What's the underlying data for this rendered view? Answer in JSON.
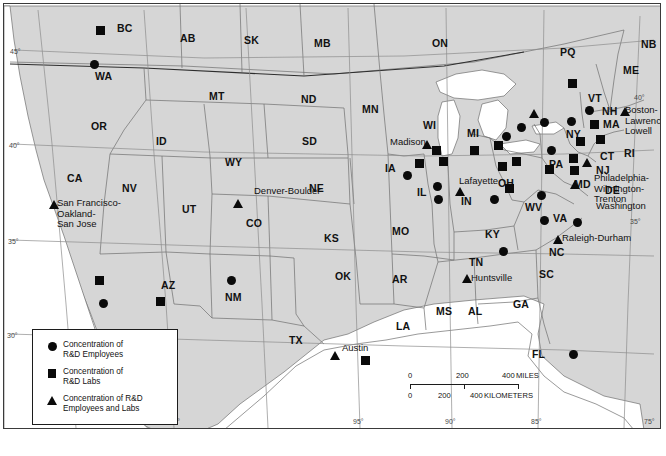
{
  "figure": {
    "background": "#ffffff",
    "land_color": "#d6d6d6",
    "marker_color": "#0a0a0a"
  },
  "legend": {
    "entries": [
      {
        "symbol": "circle",
        "label": "Concentration of\nR&D Employees"
      },
      {
        "symbol": "square",
        "label": "Concentration of\nR&D Labs"
      },
      {
        "symbol": "triangle",
        "label": "Concentration of R&D\nEmployees and Labs"
      }
    ]
  },
  "scalebar": {
    "miles": {
      "ticks": [
        "0",
        "200",
        "400"
      ],
      "unit": "MILES"
    },
    "kilometers": {
      "ticks": [
        "0",
        "200",
        "400"
      ],
      "unit": "KILOMETERS"
    }
  },
  "graticule": {
    "latitude_labels": [
      "45°",
      "40°",
      "35°",
      "30°"
    ],
    "longitude_labels": [
      "120°",
      "115°",
      "95°",
      "90°",
      "85°",
      "75°"
    ],
    "right_edge_labels": [
      "40°",
      "35°"
    ]
  },
  "state_labels": [
    {
      "text": "BC",
      "x": 113,
      "y": 18
    },
    {
      "text": "AB",
      "x": 176,
      "y": 28
    },
    {
      "text": "SK",
      "x": 240,
      "y": 30
    },
    {
      "text": "MB",
      "x": 310,
      "y": 33
    },
    {
      "text": "ON",
      "x": 428,
      "y": 33
    },
    {
      "text": "PQ",
      "x": 556,
      "y": 42
    },
    {
      "text": "NB",
      "x": 637,
      "y": 34
    },
    {
      "text": "ME",
      "x": 619,
      "y": 60
    },
    {
      "text": "WA",
      "x": 91,
      "y": 66
    },
    {
      "text": "MT",
      "x": 205,
      "y": 86
    },
    {
      "text": "ND",
      "x": 297,
      "y": 89
    },
    {
      "text": "MN",
      "x": 358,
      "y": 99
    },
    {
      "text": "WI",
      "x": 419,
      "y": 115
    },
    {
      "text": "MI",
      "x": 463,
      "y": 123
    },
    {
      "text": "VT",
      "x": 584,
      "y": 88
    },
    {
      "text": "NH",
      "x": 598,
      "y": 101
    },
    {
      "text": "MA",
      "x": 599,
      "y": 114
    },
    {
      "text": "NY",
      "x": 562,
      "y": 124
    },
    {
      "text": "OR",
      "x": 87,
      "y": 116
    },
    {
      "text": "ID",
      "x": 152,
      "y": 131
    },
    {
      "text": "SD",
      "x": 298,
      "y": 131
    },
    {
      "text": "IA",
      "x": 381,
      "y": 158
    },
    {
      "text": "PA",
      "x": 545,
      "y": 154
    },
    {
      "text": "CT",
      "x": 596,
      "y": 146
    },
    {
      "text": "RI",
      "x": 620,
      "y": 143
    },
    {
      "text": "NJ",
      "x": 592,
      "y": 160
    },
    {
      "text": "WY",
      "x": 221,
      "y": 152
    },
    {
      "text": "NE",
      "x": 305,
      "y": 178
    },
    {
      "text": "IL",
      "x": 413,
      "y": 182
    },
    {
      "text": "IN",
      "x": 457,
      "y": 191
    },
    {
      "text": "OH",
      "x": 494,
      "y": 173
    },
    {
      "text": "MD",
      "x": 570,
      "y": 174
    },
    {
      "text": "DE",
      "x": 601,
      "y": 180
    },
    {
      "text": "CA",
      "x": 63,
      "y": 168
    },
    {
      "text": "NV",
      "x": 118,
      "y": 178
    },
    {
      "text": "UT",
      "x": 178,
      "y": 199
    },
    {
      "text": "CO",
      "x": 242,
      "y": 213
    },
    {
      "text": "KS",
      "x": 320,
      "y": 228
    },
    {
      "text": "MO",
      "x": 388,
      "y": 221
    },
    {
      "text": "KY",
      "x": 481,
      "y": 224
    },
    {
      "text": "WV",
      "x": 521,
      "y": 197
    },
    {
      "text": "VA",
      "x": 549,
      "y": 208
    },
    {
      "text": "NC",
      "x": 545,
      "y": 242
    },
    {
      "text": "AZ",
      "x": 157,
      "y": 275
    },
    {
      "text": "NM",
      "x": 221,
      "y": 287
    },
    {
      "text": "OK",
      "x": 331,
      "y": 266
    },
    {
      "text": "AR",
      "x": 388,
      "y": 269
    },
    {
      "text": "TN",
      "x": 465,
      "y": 252
    },
    {
      "text": "SC",
      "x": 535,
      "y": 264
    },
    {
      "text": "MS",
      "x": 432,
      "y": 301
    },
    {
      "text": "AL",
      "x": 464,
      "y": 301
    },
    {
      "text": "GA",
      "x": 509,
      "y": 294
    },
    {
      "text": "TX",
      "x": 285,
      "y": 330
    },
    {
      "text": "LA",
      "x": 392,
      "y": 316
    },
    {
      "text": "FL",
      "x": 528,
      "y": 344
    }
  ],
  "city_labels": [
    {
      "text": "San Francisco-\nOakland-\nSan Jose",
      "x": 53,
      "y": 194
    },
    {
      "text": "Denver-Boulder",
      "x": 250,
      "y": 182
    },
    {
      "text": "Madison",
      "x": 386,
      "y": 133
    },
    {
      "text": "Lafayette",
      "x": 455,
      "y": 172
    },
    {
      "text": "Austin",
      "x": 338,
      "y": 339
    },
    {
      "text": "Huntsville",
      "x": 467,
      "y": 269
    },
    {
      "text": "Raleigh-Durham",
      "x": 558,
      "y": 229
    },
    {
      "text": "Boston-\nLawrence-\nLowell",
      "x": 621,
      "y": 101
    },
    {
      "text": "Philadelphia-\nWilmington-\nTrenton",
      "x": 590,
      "y": 169
    },
    {
      "text": "Washington",
      "x": 592,
      "y": 197
    }
  ],
  "markers": [
    {
      "symbol": "square",
      "x": 92,
      "y": 22,
      "region": "BC"
    },
    {
      "symbol": "circle",
      "x": 86,
      "y": 56,
      "region": "WA"
    },
    {
      "symbol": "square",
      "x": 564,
      "y": 75,
      "region": "PQ"
    },
    {
      "symbol": "circle",
      "x": 581,
      "y": 102,
      "region": "VT"
    },
    {
      "symbol": "triangle",
      "x": 616,
      "y": 103,
      "region": "Boston-Lawrence-Lowell"
    },
    {
      "symbol": "circle",
      "x": 536,
      "y": 114,
      "region": "NY-north"
    },
    {
      "symbol": "circle",
      "x": 563,
      "y": 113,
      "region": "NY-albany"
    },
    {
      "symbol": "square",
      "x": 586,
      "y": 116,
      "region": "MA"
    },
    {
      "symbol": "circle",
      "x": 513,
      "y": 119,
      "region": "NY-west"
    },
    {
      "symbol": "circle",
      "x": 498,
      "y": 128,
      "region": "ON-border"
    },
    {
      "symbol": "triangle",
      "x": 525,
      "y": 105,
      "region": "ON"
    },
    {
      "symbol": "square",
      "x": 592,
      "y": 131,
      "region": "MA-south"
    },
    {
      "symbol": "square",
      "x": 572,
      "y": 133,
      "region": "NY-hudson"
    },
    {
      "symbol": "circle",
      "x": 543,
      "y": 142,
      "region": "NY-south"
    },
    {
      "symbol": "square",
      "x": 565,
      "y": 150,
      "region": "NJ-north"
    },
    {
      "symbol": "triangle",
      "x": 578,
      "y": 154,
      "region": "NJ"
    },
    {
      "symbol": "square",
      "x": 566,
      "y": 162,
      "region": "PA-east"
    },
    {
      "symbol": "triangle",
      "x": 566,
      "y": 176,
      "region": "MD-Washington"
    },
    {
      "symbol": "square",
      "x": 541,
      "y": 161,
      "region": "PA-central"
    },
    {
      "symbol": "square",
      "x": 508,
      "y": 153,
      "region": "OH-north"
    },
    {
      "symbol": "square",
      "x": 494,
      "y": 158,
      "region": "OH-cleveland"
    },
    {
      "symbol": "square",
      "x": 490,
      "y": 137,
      "region": "MI-detroit"
    },
    {
      "symbol": "square",
      "x": 466,
      "y": 142,
      "region": "MI-west"
    },
    {
      "symbol": "square",
      "x": 501,
      "y": 180,
      "region": "OH-columbus"
    },
    {
      "symbol": "circle",
      "x": 486,
      "y": 191,
      "region": "OH-cincinnati"
    },
    {
      "symbol": "circle",
      "x": 533,
      "y": 187,
      "region": "VA-west"
    },
    {
      "symbol": "circle",
      "x": 536,
      "y": 212,
      "region": "VA"
    },
    {
      "symbol": "circle",
      "x": 569,
      "y": 214,
      "region": "VA-hampton"
    },
    {
      "symbol": "triangle",
      "x": 549,
      "y": 231,
      "region": "Raleigh-Durham"
    },
    {
      "symbol": "circle",
      "x": 495,
      "y": 243,
      "region": "NC-west"
    },
    {
      "symbol": "triangle",
      "x": 458,
      "y": 270,
      "region": "Huntsville"
    },
    {
      "symbol": "circle",
      "x": 565,
      "y": 346,
      "region": "FL"
    },
    {
      "symbol": "triangle",
      "x": 418,
      "y": 136,
      "region": "Madison"
    },
    {
      "symbol": "square",
      "x": 428,
      "y": 142,
      "region": "WI-milwaukee"
    },
    {
      "symbol": "square",
      "x": 411,
      "y": 155,
      "region": "IL-north"
    },
    {
      "symbol": "square",
      "x": 435,
      "y": 153,
      "region": "IL-chicago"
    },
    {
      "symbol": "circle",
      "x": 399,
      "y": 167,
      "region": "IA"
    },
    {
      "symbol": "circle",
      "x": 429,
      "y": 178,
      "region": "IL-central"
    },
    {
      "symbol": "triangle",
      "x": 451,
      "y": 183,
      "region": "Lafayette"
    },
    {
      "symbol": "circle",
      "x": 430,
      "y": 191,
      "region": "IL-south"
    },
    {
      "symbol": "triangle",
      "x": 229,
      "y": 195,
      "region": "Denver-Boulder"
    },
    {
      "symbol": "triangle",
      "x": 45,
      "y": 196,
      "region": "San Francisco-Oakland-San Jose"
    },
    {
      "symbol": "square",
      "x": 91,
      "y": 272,
      "region": "CA-south"
    },
    {
      "symbol": "circle",
      "x": 95,
      "y": 295,
      "region": "CA-sandiego"
    },
    {
      "symbol": "square",
      "x": 152,
      "y": 293,
      "region": "AZ"
    },
    {
      "symbol": "circle",
      "x": 223,
      "y": 272,
      "region": "NM"
    },
    {
      "symbol": "triangle",
      "x": 326,
      "y": 347,
      "region": "Austin"
    },
    {
      "symbol": "square",
      "x": 357,
      "y": 352,
      "region": "TX-houston"
    }
  ]
}
